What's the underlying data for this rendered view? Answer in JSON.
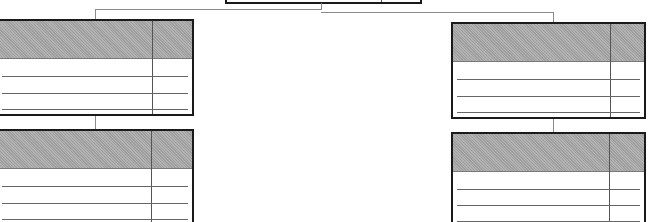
{
  "diagram": {
    "type": "entity-relationship schematic",
    "colors": {
      "border": "#1a1a1a",
      "header_fill": "#a9a9a9",
      "row_line": "#666666",
      "connector": "#8a8a8a",
      "background": "#ffffff"
    },
    "nodes": [
      {
        "id": "root",
        "role": "parent-table",
        "header_label": "",
        "rows": []
      },
      {
        "id": "left-top",
        "role": "child-table",
        "header_label": "",
        "row_count": 3
      },
      {
        "id": "left-bottom",
        "role": "child-table",
        "header_label": "",
        "row_count": 3
      },
      {
        "id": "right-top",
        "role": "child-table",
        "header_label": "",
        "row_count": 3
      },
      {
        "id": "right-bottom",
        "role": "child-table",
        "header_label": "",
        "row_count": 3
      }
    ],
    "edges": [
      {
        "from": "root",
        "to": "left-top"
      },
      {
        "from": "root",
        "to": "right-top"
      },
      {
        "from": "left-top",
        "to": "left-bottom"
      },
      {
        "from": "right-top",
        "to": "right-bottom"
      }
    ]
  }
}
